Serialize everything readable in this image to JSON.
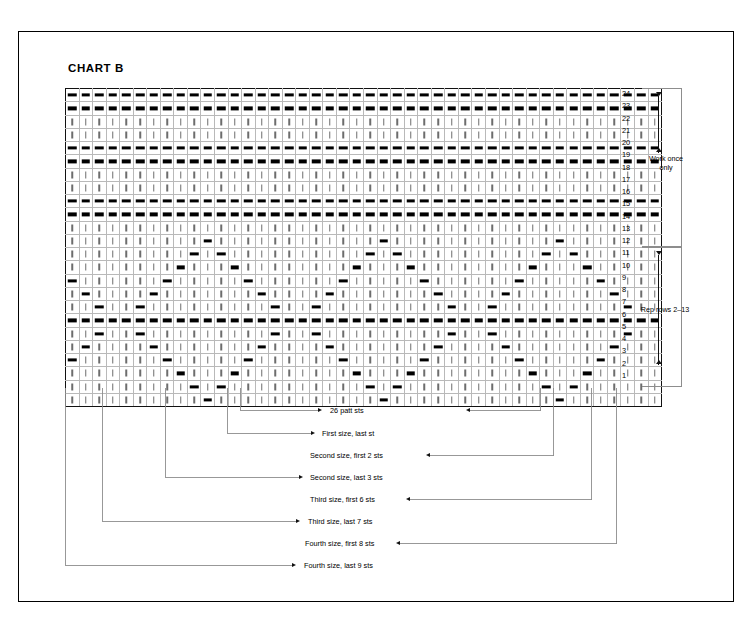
{
  "title": "CHART B",
  "grid": {
    "columns": 44,
    "rows": 24,
    "symbols": {
      "knit": "|",
      "purl": "-"
    },
    "row_numbers": [
      24,
      23,
      22,
      21,
      20,
      19,
      18,
      17,
      16,
      15,
      14,
      13,
      11,
      12,
      10,
      9,
      8,
      7,
      6,
      5,
      4,
      3,
      2,
      1
    ],
    "row_numbers_desc": [
      24,
      23,
      22,
      21,
      20,
      19,
      18,
      17,
      16,
      15,
      14,
      13,
      12,
      11,
      10,
      9,
      8,
      7,
      6,
      5,
      4,
      3,
      2,
      1
    ],
    "thick_column_lines": [
      5,
      11,
      14,
      37,
      40
    ],
    "pattern_rows_desc": [
      {
        "row": 24,
        "type": "purl-all"
      },
      {
        "row": 23,
        "type": "purl-all"
      },
      {
        "row": 22,
        "type": "knit-all"
      },
      {
        "row": 21,
        "type": "knit-all"
      },
      {
        "row": 20,
        "type": "purl-all"
      },
      {
        "row": 19,
        "type": "purl-all"
      },
      {
        "row": 18,
        "type": "knit-all"
      },
      {
        "row": 17,
        "type": "knit-all"
      },
      {
        "row": 16,
        "type": "purl-all"
      },
      {
        "row": 15,
        "type": "purl-all"
      },
      {
        "row": 14,
        "type": "knit-all"
      },
      {
        "row": 13,
        "type": "chevron",
        "purls": [
          11,
          24,
          37
        ]
      },
      {
        "row": 12,
        "type": "chevron",
        "purls": [
          10,
          12,
          23,
          25,
          36,
          38
        ]
      },
      {
        "row": 11,
        "type": "chevron",
        "purls": [
          9,
          13,
          22,
          26,
          35,
          39
        ]
      },
      {
        "row": 10,
        "type": "chevron",
        "purls": [
          8,
          14,
          21,
          27,
          34,
          40
        ]
      },
      {
        "row": 9,
        "type": "chevron",
        "purls": [
          7,
          15,
          20,
          28,
          33,
          41
        ]
      },
      {
        "row": 8,
        "type": "chevron",
        "purls": [
          6,
          16,
          19,
          29,
          32,
          42
        ]
      },
      {
        "row": 7,
        "type": "purl-all"
      },
      {
        "row": 6,
        "type": "chevron",
        "purls": [
          6,
          16,
          19,
          29,
          32,
          42
        ]
      },
      {
        "row": 5,
        "type": "chevron",
        "purls": [
          7,
          15,
          20,
          28,
          33,
          41
        ]
      },
      {
        "row": 4,
        "type": "chevron",
        "purls": [
          8,
          14,
          21,
          27,
          34,
          40
        ]
      },
      {
        "row": 3,
        "type": "chevron",
        "purls": [
          9,
          13,
          22,
          26,
          35,
          39
        ]
      },
      {
        "row": 2,
        "type": "chevron",
        "purls": [
          10,
          12,
          23,
          25,
          36,
          38
        ]
      },
      {
        "row": 1,
        "type": "chevron",
        "purls": [
          11,
          24,
          37
        ]
      }
    ]
  },
  "brackets": {
    "work_once": {
      "label_line1": "Work once",
      "label_line2": "only"
    },
    "repeat": {
      "label": "Rep rows 2–13"
    }
  },
  "annotations": [
    {
      "id": "patt-sts",
      "label": "26 patt sts",
      "arrows": "both"
    },
    {
      "id": "first-last",
      "label": "First size, last st",
      "arrows": "left"
    },
    {
      "id": "second-first2",
      "label": "Second size, first 2 sts",
      "arrows": "right"
    },
    {
      "id": "second-last3",
      "label": "Second size, last 3 sts",
      "arrows": "left"
    },
    {
      "id": "third-first6",
      "label": "Third size, first 6 sts",
      "arrows": "right"
    },
    {
      "id": "third-last7",
      "label": "Third size, last 7 sts",
      "arrows": "left"
    },
    {
      "id": "fourth-first8",
      "label": "Fourth size, first 8 sts",
      "arrows": "right"
    },
    {
      "id": "fourth-last9",
      "label": "Fourth size, last 9 sts",
      "arrows": "left"
    }
  ],
  "colors": {
    "ink": "#000000",
    "grid_line": "#b9b9b9",
    "thick_line": "#1a1a1a",
    "leader_line": "#8d8d8d",
    "knit_symbol": "#6d6d6d",
    "purl_symbol": "#000000"
  }
}
